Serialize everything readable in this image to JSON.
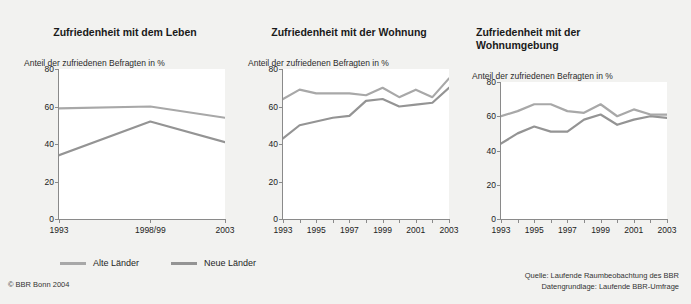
{
  "figure": {
    "background_color": "#f2f2f0",
    "plot_background_color": "#ffffff",
    "axis_color": "#8a8a8a"
  },
  "legend": {
    "entries": [
      {
        "label": "Alte Länder",
        "color": "#a8a8a8"
      },
      {
        "label": "Neue Länder",
        "color": "#949494"
      }
    ]
  },
  "copyright": "© BBR Bonn 2004",
  "source": {
    "line1": "Quelle: Laufende Raumbeobachtung des BBR",
    "line2": "Datengrundlage: Laufende BBR-Umfrage"
  },
  "chart_data": [
    {
      "type": "line",
      "title": "Zufriedenheit mit dem Leben",
      "title_line2": "",
      "subtitle": "Anteil der zufriedenen Befragten in %",
      "xlabel": "",
      "ylabel": "",
      "ylim": [
        0,
        80
      ],
      "yticks": [
        0,
        20,
        40,
        60,
        80
      ],
      "ytick_labels": [
        "0",
        "20",
        "40",
        "60",
        "80"
      ],
      "x": [
        1993,
        1998.5,
        2003
      ],
      "xtick_labels": [
        "1993",
        "1998/99",
        "2003"
      ],
      "xtick_values": [
        1993,
        1998.5,
        2003
      ],
      "xlim": [
        1993,
        2003
      ],
      "grid": false,
      "legend_position": "below-figure",
      "series": [
        {
          "name": "Alte Länder",
          "color": "#a8a8a8",
          "values": [
            59,
            60,
            54
          ]
        },
        {
          "name": "Neue Länder",
          "color": "#949494",
          "values": [
            34,
            52,
            41
          ]
        }
      ]
    },
    {
      "type": "line",
      "title": "Zufriedenheit mit der Wohnung",
      "title_line2": "",
      "subtitle": "Anteil der zufriedenen Befragten in %",
      "xlabel": "",
      "ylabel": "",
      "ylim": [
        0,
        80
      ],
      "yticks": [
        0,
        20,
        40,
        60,
        80
      ],
      "ytick_labels": [
        "0",
        "20",
        "40",
        "60",
        "80"
      ],
      "x": [
        1993,
        1994,
        1995,
        1996,
        1997,
        1998,
        1999,
        2000,
        2001,
        2002,
        2003
      ],
      "xtick_labels": [
        "1993",
        "1995",
        "1997",
        "1999",
        "2001",
        "2003"
      ],
      "xtick_values": [
        1993,
        1995,
        1997,
        1999,
        2001,
        2003
      ],
      "xlim": [
        1993,
        2003
      ],
      "grid": false,
      "legend_position": "below-figure",
      "series": [
        {
          "name": "Alte Länder",
          "color": "#a8a8a8",
          "values": [
            64,
            69,
            67,
            67,
            67,
            66,
            70,
            65,
            69,
            65,
            75
          ]
        },
        {
          "name": "Neue Länder",
          "color": "#949494",
          "values": [
            43,
            50,
            52,
            54,
            55,
            63,
            64,
            60,
            61,
            62,
            70
          ]
        }
      ]
    },
    {
      "type": "line",
      "title": "Zufriedenheit mit der",
      "title_line2": "Wohnumgebung",
      "subtitle": "Anteil der zufriedenen Befragten in %",
      "xlabel": "",
      "ylabel": "",
      "ylim": [
        0,
        80
      ],
      "yticks": [
        0,
        20,
        40,
        60,
        80
      ],
      "ytick_labels": [
        "0",
        "20",
        "40",
        "60",
        "80"
      ],
      "x": [
        1993,
        1994,
        1995,
        1996,
        1997,
        1998,
        1999,
        2000,
        2001,
        2002,
        2003
      ],
      "xtick_labels": [
        "1993",
        "1995",
        "1997",
        "1999",
        "2001",
        "2003"
      ],
      "xtick_values": [
        1993,
        1995,
        1997,
        1999,
        2001,
        2003
      ],
      "xlim": [
        1993,
        2003
      ],
      "grid": false,
      "legend_position": "below-figure",
      "series": [
        {
          "name": "Alte Länder",
          "color": "#a8a8a8",
          "values": [
            60,
            63,
            67,
            67,
            63,
            62,
            67,
            60,
            64,
            61,
            61
          ]
        },
        {
          "name": "Neue Länder",
          "color": "#949494",
          "values": [
            44,
            50,
            54,
            51,
            51,
            58,
            61,
            55,
            58,
            60,
            59
          ]
        }
      ]
    }
  ]
}
